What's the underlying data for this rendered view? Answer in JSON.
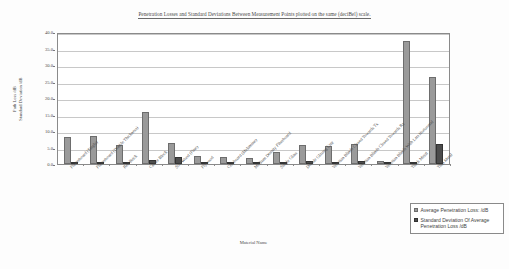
{
  "chart_data": {
    "type": "bar",
    "title": "Penetration Losses and Standard Deviations Between Measurement Points plotted on the same (deciBel) scale.",
    "xlabel": "Material Name",
    "ylabel_line1": "Path Loss /dB",
    "ylabel_line2": "Standard Deviation /dB",
    "ylim": [
      0.0,
      40.0
    ],
    "ytick_labels": [
      "0.0",
      "5.0",
      "10.0",
      "15.0",
      "20.0",
      "25.0",
      "30.0",
      "35.0",
      "40.0"
    ],
    "ytick_values": [
      0.0,
      5.0,
      10.0,
      15.0,
      20.0,
      25.0,
      30.0,
      35.0,
      40.0
    ],
    "grid": true,
    "legend_position": "bottom-right",
    "categories": [
      "Plasterboard (Single)",
      "Plasterboard (Double Thickness)",
      "Red Brick",
      "Cinder Block",
      "Soft Wood (Pine)",
      "Plywood",
      "Chipboard (Melamine)",
      "Medium Density Fibreboard",
      "Single Glass",
      "Double Glazing Unit",
      "Venetian Blinds Closed Towards Tx",
      "Venetian Blinds Closed Towards Rx",
      "Venetian Blinds With Lats Horizontal",
      "Thick Metal",
      "Thin Metal"
    ],
    "series": [
      {
        "name": "Average Penetration Loss: /dB",
        "color": "#9a9a9a",
        "values": [
          8.2,
          8.6,
          5.8,
          15.9,
          6.5,
          2.4,
          2.1,
          1.8,
          3.7,
          5.9,
          5.5,
          6.0,
          1.0,
          37.4,
          26.3
        ]
      },
      {
        "name": "Standard Deviation Of Average Penetration Loss /dB",
        "color": "#4c4c4c",
        "values": [
          0.4,
          0.4,
          0.5,
          1.2,
          2.0,
          0.6,
          0.4,
          0.6,
          0.3,
          0.8,
          0.4,
          0.9,
          0.2,
          0.0,
          6.1
        ]
      }
    ]
  },
  "legend": {
    "entries": [
      {
        "label": "Average Penetration Loss: /dB"
      },
      {
        "label": "Standard Deviation Of Average Penetration Loss /dB"
      }
    ]
  }
}
